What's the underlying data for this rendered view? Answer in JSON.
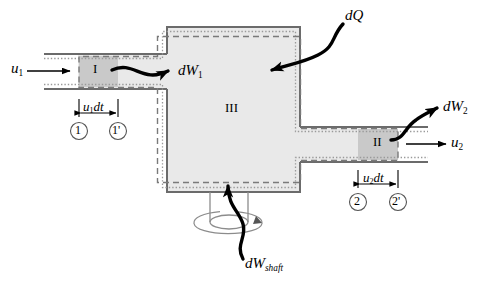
{
  "figure": {
    "colors": {
      "wall": "#6b6b6b",
      "chamber_fill": "#e9e9e9",
      "region_fill": "#c9c9c9",
      "dashed_boundary": "#7a7a7a",
      "dotted_boundary": "#9a9a9a",
      "arrow": "#000000",
      "shaft": "#8c8c8c",
      "background": "#ffffff"
    }
  },
  "labels": {
    "inlet_velocity": {
      "symbol": "u",
      "subscript": "1",
      "text": "u1"
    },
    "outlet_velocity": {
      "symbol": "u",
      "subscript": "2",
      "text": "u2"
    },
    "region_one": "I",
    "region_two": "II",
    "region_three": "III",
    "flow_work_inlet": {
      "d": "d",
      "symbol": "W",
      "subscript": "1",
      "text": "dW1"
    },
    "flow_work_outlet": {
      "d": "d",
      "symbol": "W",
      "subscript": "2",
      "text": "dW2"
    },
    "heat": {
      "d": "d",
      "symbol": "Q",
      "text": "dQ"
    },
    "shaft_work": {
      "d": "d",
      "symbol": "W",
      "subscript": "shaft",
      "text": "dWshaft"
    },
    "inlet_length": {
      "symbol": "u",
      "subscript": "1",
      "suffix": "dt",
      "text": "u1dt"
    },
    "outlet_length": {
      "symbol": "u",
      "subscript": "2",
      "suffix": "dt",
      "text": "u2dt"
    },
    "station_1": "1",
    "station_1_prime": "1'",
    "station_2": "2",
    "station_2_prime": "2'"
  }
}
